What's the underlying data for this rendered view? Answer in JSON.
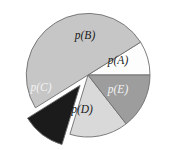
{
  "chart_data": {
    "type": "pie",
    "title": "",
    "subtitle": "",
    "xlabel": "",
    "ylabel": "",
    "grid": false,
    "legend": "none",
    "labels_inside_slices": true,
    "background_color": "#ffffff",
    "outline_color": "#6e6e6e",
    "center": {
      "x": 88,
      "y": 75
    },
    "radius": 62,
    "categories": [
      "p(A)",
      "p(B)",
      "p(C)",
      "p(D)",
      "p(E)"
    ],
    "values": [
      9,
      49,
      11,
      16,
      15
    ],
    "units": "percent",
    "slices": [
      {
        "label": "p(A)",
        "value": 9,
        "start_angle_deg": -32,
        "end_angle_deg": 0,
        "fill": "#fdfdfd",
        "text_color": "#1a1a1a",
        "exploded": false,
        "explode_offset": 0,
        "label_x": 118,
        "label_y": 61
      },
      {
        "label": "p(B)",
        "value": 49,
        "start_angle_deg": -212,
        "end_angle_deg": -32,
        "fill": "#c6c6c6",
        "text_color": "#1a1a1a",
        "exploded": false,
        "explode_offset": 0,
        "label_x": 85,
        "label_y": 36
      },
      {
        "label": "p(C)",
        "value": 11,
        "start_angle_deg": -253,
        "end_angle_deg": -212,
        "fill": "#1b1b1b",
        "text_color": "#f2f2f2",
        "exploded": true,
        "explode_offset": 13,
        "label_x": 41,
        "label_y": 88
      },
      {
        "label": "p(D)",
        "value": 16,
        "start_angle_deg": 107,
        "end_angle_deg": 52,
        "fill": "#d9d9d9",
        "text_color": "#1a1a1a",
        "exploded": false,
        "explode_offset": 0,
        "label_x": 82,
        "label_y": 110
      },
      {
        "label": "p(E)",
        "value": 15,
        "start_angle_deg": 0,
        "end_angle_deg": 52,
        "fill": "#9d9d9d",
        "text_color": "#f2f2f2",
        "exploded": false,
        "explode_offset": 0,
        "label_x": 118,
        "label_y": 90
      }
    ]
  }
}
